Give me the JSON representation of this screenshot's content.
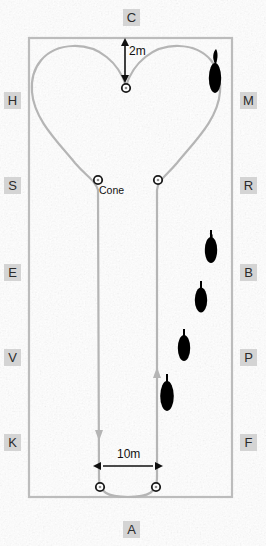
{
  "figure": {
    "kind": "dressage-arena-diagram",
    "background_color": "#f2f2f2",
    "arena_line_color": "#b9b9b9",
    "path_line_color": "#b5b5b5",
    "marker_color": "#000000",
    "letter_box_color": "#d4d4d4",
    "letter_text_color": "#2b2b2b",
    "text_color": "#111111"
  },
  "arena": {
    "letters": [
      {
        "id": "C",
        "label": "C",
        "x": 123,
        "y": 9,
        "side": "top"
      },
      {
        "id": "H",
        "label": "H",
        "x": 4,
        "y": 92,
        "side": "left"
      },
      {
        "id": "M",
        "label": "M",
        "x": 240,
        "y": 92,
        "side": "right"
      },
      {
        "id": "S",
        "label": "S",
        "x": 4,
        "y": 177,
        "side": "left"
      },
      {
        "id": "R",
        "label": "R",
        "x": 240,
        "y": 177,
        "side": "right"
      },
      {
        "id": "E",
        "label": "E",
        "x": 4,
        "y": 264,
        "side": "left"
      },
      {
        "id": "B",
        "label": "B",
        "x": 240,
        "y": 264,
        "side": "right"
      },
      {
        "id": "V",
        "label": "V",
        "x": 4,
        "y": 349,
        "side": "left"
      },
      {
        "id": "P",
        "label": "P",
        "x": 240,
        "y": 349,
        "side": "right"
      },
      {
        "id": "K",
        "label": "K",
        "x": 4,
        "y": 434,
        "side": "left"
      },
      {
        "id": "F",
        "label": "F",
        "x": 240,
        "y": 434,
        "side": "right"
      },
      {
        "id": "A",
        "label": "A",
        "x": 123,
        "y": 521,
        "side": "bottom"
      }
    ],
    "boundary": {
      "x": 29,
      "y": 38,
      "width": 203,
      "height": 459
    }
  },
  "annotations": {
    "vertical_measure": {
      "label": "2m",
      "x": 129,
      "y": 44,
      "arrow_x": 125,
      "arrow_top": 40,
      "arrow_bottom": 80
    },
    "horizontal_measure": {
      "label": "10m",
      "x": 117,
      "y": 449,
      "arrow_y": 466,
      "arrow_left": 99,
      "arrow_right": 159
    },
    "cone_label": {
      "label": "Cone",
      "x": 99,
      "y": 186
    }
  },
  "cones": [
    {
      "name": "cone-top-center",
      "cx": 126,
      "cy": 88
    },
    {
      "name": "cone-mid-left",
      "cx": 98,
      "cy": 180
    },
    {
      "name": "cone-mid-right",
      "cx": 158,
      "cy": 180
    },
    {
      "name": "cone-bottom-left",
      "cx": 100,
      "cy": 487
    },
    {
      "name": "cone-bottom-right",
      "cx": 156,
      "cy": 487
    }
  ],
  "markers": [
    {
      "name": "marker-1",
      "cx": 215,
      "cy": 76,
      "rx": 6.5,
      "ry": 19
    },
    {
      "name": "marker-2",
      "cx": 211,
      "cy": 248,
      "rx": 6.5,
      "ry": 17
    },
    {
      "name": "marker-3",
      "cx": 200,
      "cy": 299,
      "rx": 6.5,
      "ry": 16
    },
    {
      "name": "marker-4",
      "cx": 183,
      "cy": 347,
      "rx": 6.5,
      "ry": 17
    },
    {
      "name": "marker-5",
      "cx": 166,
      "cy": 396,
      "rx": 7,
      "ry": 19
    }
  ],
  "path": {
    "description": "heart-shaped serpentine loop with two parallel straights down the centre",
    "left_loop": "M126,86 C118,64 96,46 72,47 C44,48 30,68 32,92 C34,118 58,142 76,164 C88,178 94,180 98,188",
    "right_loop": "M126,86 C134,64 156,46 180,47 C208,48 222,68 220,92 C218,118 194,142 176,164 C164,178 158,180 156,188",
    "left_straight": "M98,188 L99,478",
    "right_straight": "M157,188 L157,478",
    "bottom_curve": "M99,478 C99,492 106,497 128,497 C150,497 157,492 157,478",
    "arrowheads": [
      {
        "name": "arrow-left-down",
        "x": 99,
        "y": 437,
        "dir": "down"
      },
      {
        "name": "arrow-right-up",
        "x": 157,
        "y": 370,
        "dir": "up"
      }
    ]
  }
}
